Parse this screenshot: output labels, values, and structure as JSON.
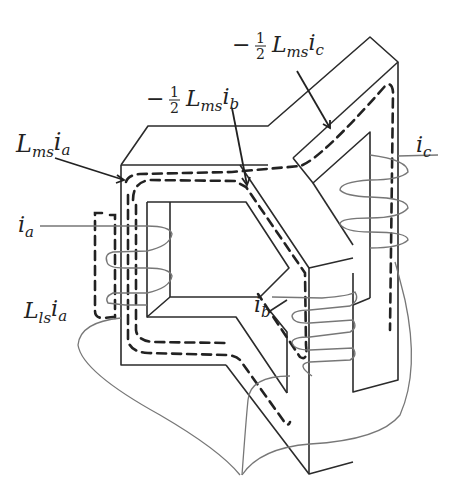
{
  "diagram": {
    "labels": {
      "mutual_a": {
        "main": "L",
        "sub1": "ms",
        "i": "i",
        "sub2": "a"
      },
      "mutual_b": {
        "prefix": "−",
        "num": "1",
        "den": "2",
        "main": "L",
        "sub1": "ms",
        "i": "i",
        "sub2": "b"
      },
      "mutual_c": {
        "prefix": "−",
        "num": "1",
        "den": "2",
        "main": "L",
        "sub1": "ms",
        "i": "i",
        "sub2": "c"
      },
      "leak_a": {
        "main": "L",
        "sub1": "ls",
        "i": "i",
        "sub2": "a"
      },
      "current_a": {
        "i": "i",
        "sub": "a"
      },
      "current_b": {
        "i": "i",
        "sub": "b"
      },
      "current_c": {
        "i": "i",
        "sub": "c"
      }
    },
    "colors": {
      "core_line": "#2b2b2b",
      "flux_dash": "#222222",
      "coil_wire": "#777777",
      "background": "#ffffff"
    }
  }
}
